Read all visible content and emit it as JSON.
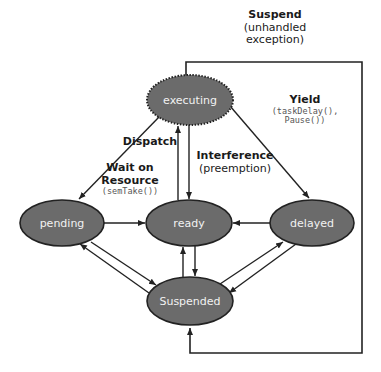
{
  "diagram": {
    "type": "state-machine",
    "colors": {
      "state_fill": "#6b6b6b",
      "state_stroke": "#222222",
      "state_text": "#f2f2f2",
      "edge": "#222222",
      "label_text": "#1a1a1a",
      "code_text": "#555555"
    },
    "states": [
      {
        "id": "executing",
        "label": "executing",
        "style": "dotted-border"
      },
      {
        "id": "pending",
        "label": "pending"
      },
      {
        "id": "ready",
        "label": "ready"
      },
      {
        "id": "delayed",
        "label": "delayed"
      },
      {
        "id": "suspended",
        "label": "Suspended"
      }
    ],
    "labels": {
      "suspend": {
        "title": "Suspend",
        "line1": "(unhandled",
        "line2": "exception)"
      },
      "yield": {
        "title": "Yield",
        "code1": "(taskDelay(),",
        "code2": "Pause())"
      },
      "dispatch": {
        "title": "Dispatch"
      },
      "wait": {
        "title1": "Wait on",
        "title2": "Resource",
        "code": "(semTake())"
      },
      "interference": {
        "title": "Interference",
        "sub": "(preemption)"
      }
    },
    "transitions": [
      {
        "from": "ready",
        "to": "executing",
        "label": "Dispatch"
      },
      {
        "from": "executing",
        "to": "ready",
        "label": "Interference (preemption)"
      },
      {
        "from": "executing",
        "to": "pending",
        "label": "Wait on Resource (semTake())"
      },
      {
        "from": "executing",
        "to": "delayed",
        "label": "Yield (taskDelay(), Pause())"
      },
      {
        "from": "executing",
        "to": "suspended",
        "label": "Suspend (unhandled exception)"
      },
      {
        "from": "pending",
        "to": "ready"
      },
      {
        "from": "delayed",
        "to": "ready"
      },
      {
        "from": "pending",
        "to": "suspended"
      },
      {
        "from": "suspended",
        "to": "pending"
      },
      {
        "from": "ready",
        "to": "suspended"
      },
      {
        "from": "suspended",
        "to": "ready"
      },
      {
        "from": "delayed",
        "to": "suspended"
      },
      {
        "from": "suspended",
        "to": "delayed"
      }
    ]
  }
}
